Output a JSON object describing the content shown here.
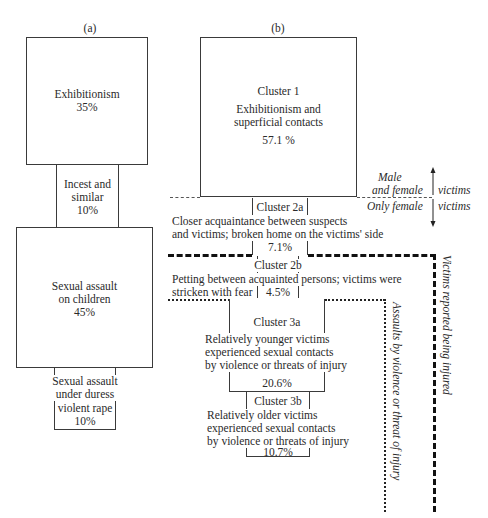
{
  "panel_a": {
    "label": "(a)",
    "boxes": [
      {
        "lines": [
          "Exhibitionism",
          "35%"
        ],
        "percent": 35
      },
      {
        "lines": [
          "Incest and",
          "similar",
          "10%"
        ],
        "percent": 10
      },
      {
        "lines": [
          "Sexual assault",
          "on children",
          "45%"
        ],
        "percent": 45
      },
      {
        "lines": [
          "Sexual assault",
          "under duress",
          "violent rape",
          "10%"
        ],
        "percent": 10
      }
    ]
  },
  "panel_b": {
    "label": "(b)",
    "cluster1": {
      "name": "Cluster 1",
      "desc": [
        "Exhibitionism and",
        "superficial contacts"
      ],
      "value": "57.1 %",
      "percent": 57.1
    },
    "cluster2a": {
      "name": "Cluster 2a",
      "desc": [
        "Closer acquaintance between suspects",
        "and victims; broken home on the victims' side"
      ],
      "value": "7.1%",
      "percent": 7.1
    },
    "cluster2b": {
      "name": "Cluster 2b",
      "desc": [
        "Petting between acquainted persons;  victims were",
        "stricken with fear"
      ],
      "value": "4.5%",
      "percent": 4.5
    },
    "cluster3a": {
      "name": "Cluster 3a",
      "desc": [
        "Relatively younger victims",
        "experienced sexual contacts",
        "by violence or threats of injury"
      ],
      "value": "20.6%",
      "percent": 20.6
    },
    "cluster3b": {
      "name": "Cluster 3b",
      "desc": [
        "Relatively older victims",
        "experienced sexual contacts",
        "by violence or threats of injury"
      ],
      "value": "10.7%",
      "percent": 10.7
    }
  },
  "annotations": {
    "male_female": [
      "Male",
      "and female"
    ],
    "only_female": "Only female",
    "victims_top": "victims",
    "victims_bottom": "victims",
    "assaults_violence": "Assaults by violence or threat of injury",
    "victims_injured": "Victims reported being injured"
  }
}
